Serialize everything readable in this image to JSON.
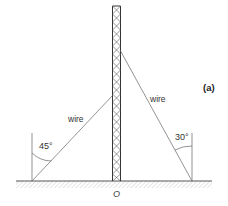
{
  "figure": {
    "label": "(a)",
    "origin_label": "O",
    "colors": {
      "line": "#555555",
      "tower": "#444444",
      "ground_hatch": "#bbbbbb",
      "text": "#333333"
    }
  },
  "wires": [
    {
      "label": "wire",
      "angle_label": "45°",
      "side": "left"
    },
    {
      "label": "wire",
      "angle_label": "30°",
      "side": "right"
    }
  ],
  "tower": {
    "description": "lattice mast"
  }
}
